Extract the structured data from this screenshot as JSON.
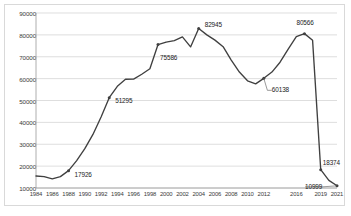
{
  "chart_data": {
    "type": "line",
    "title": "",
    "xlabel": "",
    "ylabel": "",
    "ylim": [
      10000,
      90000
    ],
    "ytick_labels": [
      "90000",
      "80000",
      "70000",
      "60000",
      "50000",
      "40000",
      "30000",
      "20000",
      "10000"
    ],
    "ytick_values": [
      90000,
      80000,
      70000,
      60000,
      50000,
      40000,
      30000,
      20000,
      10000
    ],
    "xtick_labels": [
      "1984",
      "1986",
      "1988",
      "1990",
      "1992",
      "1994",
      "1996",
      "1998",
      "2000",
      "2002",
      "2004",
      "2006",
      "2008",
      "2010",
      "2012",
      "2016",
      "2019",
      "2021"
    ],
    "grid": true,
    "legend": "none",
    "x": [
      1984,
      1985,
      1986,
      1987,
      1988,
      1989,
      1990,
      1991,
      1992,
      1993,
      1994,
      1995,
      1996,
      1997,
      1998,
      1999,
      2000,
      2001,
      2002,
      2003,
      2004,
      2005,
      2006,
      2007,
      2008,
      2009,
      2010,
      2011,
      2012,
      2013,
      2014,
      2015,
      2016,
      2017,
      2018,
      2019,
      2020,
      2021
    ],
    "values": [
      15500,
      15200,
      14200,
      15200,
      17926,
      22500,
      28000,
      34500,
      42500,
      51295,
      56500,
      59700,
      59800,
      62000,
      64500,
      75586,
      76700,
      77400,
      79100,
      74500,
      82945,
      80000,
      77600,
      74600,
      68500,
      63000,
      59000,
      57600,
      60138,
      63000,
      67500,
      73500,
      79200,
      80566,
      77500,
      18374,
      13500,
      10999
    ],
    "annotations": [
      {
        "label": "17926",
        "year": 1988,
        "value": 17926
      },
      {
        "label": "51295",
        "year": 1993,
        "value": 51295
      },
      {
        "label": "75586",
        "year": 1999,
        "value": 75586
      },
      {
        "label": "82945",
        "year": 2004,
        "value": 82945
      },
      {
        "label": "60138",
        "year": 2012,
        "value": 60138
      },
      {
        "label": "80566",
        "year": 2017,
        "value": 80566
      },
      {
        "label": "18374",
        "year": 2019,
        "value": 18374
      },
      {
        "label": "10999",
        "year": 2021,
        "value": 10999
      }
    ],
    "series_color": "#404040",
    "grid_color": "#d0d0d0",
    "border_color": "#d9d9d9"
  }
}
